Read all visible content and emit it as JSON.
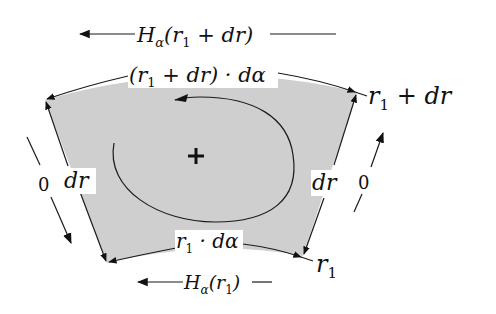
{
  "diagram": {
    "type": "annular-sector-element",
    "colors": {
      "fill": "#cfcfcf",
      "stroke": "#1a1a1a",
      "background": "#ffffff"
    },
    "top_force": {
      "symbol": "H",
      "subscript": "α",
      "argument": "(r",
      "arg_sub": "1",
      "arg_tail": " + dr)"
    },
    "bottom_force": {
      "symbol": "H",
      "subscript": "α",
      "argument": "(r",
      "arg_sub": "1",
      "arg_tail": ")"
    },
    "outer_arc_label": {
      "pre": "(r",
      "sub": "1",
      "post": " + dr) · dα"
    },
    "inner_arc_label": {
      "pre": "r",
      "sub": "1",
      "post": " · dα"
    },
    "outer_radius_label": {
      "pre": "r",
      "sub": "1",
      "post": " + dr"
    },
    "inner_radius_label": {
      "pre": "r",
      "sub": "1"
    },
    "left_side": {
      "dr_label": "dr",
      "zero_label": "0"
    },
    "right_side": {
      "dr_label": "dr",
      "zero_label": "0"
    },
    "center_symbol": "+"
  }
}
